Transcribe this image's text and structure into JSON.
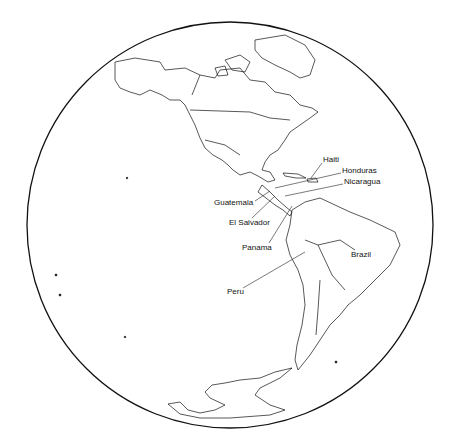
{
  "map": {
    "projection": "orthographic globe",
    "region": "Western Hemisphere (Americas)",
    "labels": [
      {
        "id": "haiti",
        "text": "Haiti",
        "x": 323,
        "y": 160
      },
      {
        "id": "honduras",
        "text": "Honduras",
        "x": 342,
        "y": 171
      },
      {
        "id": "nicaragua",
        "text": "Nicaragua",
        "x": 344,
        "y": 182
      },
      {
        "id": "guatemala",
        "text": "Guatemala",
        "x": 214,
        "y": 201
      },
      {
        "id": "el-salvador",
        "text": "El Salvador",
        "x": 229,
        "y": 220
      },
      {
        "id": "panama",
        "text": "Panama",
        "x": 242,
        "y": 246
      },
      {
        "id": "brazil",
        "text": "Brazil",
        "x": 351,
        "y": 253
      },
      {
        "id": "peru",
        "text": "Peru",
        "x": 227,
        "y": 290
      }
    ],
    "colors": {
      "outline": "#111111",
      "background": "#ffffff"
    }
  }
}
